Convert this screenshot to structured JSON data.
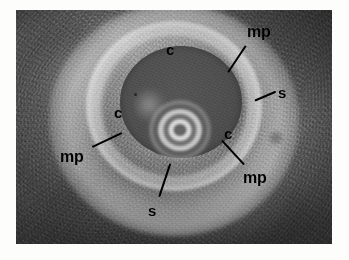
{
  "image": {
    "kind": "intravascular-ultrasound-cross-section",
    "frame": {
      "left": 16,
      "top": 10,
      "width": 316,
      "height": 234
    },
    "background_color": "#fdfdfb",
    "tissue_color": "#6e6e6e",
    "lumen_color": "#525252",
    "annotation_color": "#000000"
  },
  "annotations": {
    "items": [
      {
        "key": "c_top",
        "label": "c",
        "x": 166,
        "y": 42,
        "has_leader": false
      },
      {
        "key": "mp_topright",
        "label": "mp",
        "x": 247,
        "y": 24,
        "has_leader": true
      },
      {
        "key": "s_right",
        "label": "s",
        "x": 278,
        "y": 85,
        "has_leader": true
      },
      {
        "key": "c_left",
        "label": "c",
        "x": 114,
        "y": 105,
        "has_leader": false
      },
      {
        "key": "c_right",
        "label": "c",
        "x": 224,
        "y": 126,
        "has_leader": false
      },
      {
        "key": "mp_left",
        "label": "mp",
        "x": 60,
        "y": 149,
        "has_leader": true
      },
      {
        "key": "mp_bottomright",
        "label": "mp",
        "x": 243,
        "y": 170,
        "has_leader": true
      },
      {
        "key": "s_bottom",
        "label": "s",
        "x": 148,
        "y": 203,
        "has_leader": true
      }
    ],
    "leaders": [
      {
        "key": "leader_mp_topright",
        "x1": 246,
        "y1": 45,
        "x2": 228,
        "y2": 72
      },
      {
        "key": "leader_s_right",
        "x1": 276,
        "y1": 91,
        "x2": 255,
        "y2": 100
      },
      {
        "key": "leader_mp_left",
        "x1": 92,
        "y1": 146,
        "x2": 122,
        "y2": 132
      },
      {
        "key": "leader_mp_bottomright",
        "x1": 244,
        "y1": 164,
        "x2": 222,
        "y2": 140
      },
      {
        "key": "leader_s_bottom",
        "x1": 159,
        "y1": 196,
        "x2": 170,
        "y2": 163
      }
    ],
    "legend_meaning": {
      "c": "calcium",
      "mp": "media-plaque",
      "s": "shadow"
    }
  },
  "catheter": {
    "center_x": 180,
    "center_y": 130,
    "ring_count": 6
  }
}
